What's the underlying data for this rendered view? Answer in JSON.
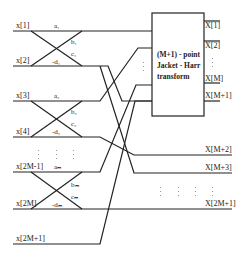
{
  "diagram": {
    "block": {
      "line1": "(M+1) - point",
      "line2": "Jacket - Harr",
      "line3": "transform"
    },
    "inputs": [
      "x[1]",
      "x[2]",
      "x[3]",
      "x[4]",
      "x[2M-1]",
      "x[2M]",
      "x[2M+1]"
    ],
    "coefficients": {
      "a1": "a₁",
      "b1": "b₁",
      "c1": "c₁",
      "d1": "-d₁",
      "a2": "a₂",
      "b2": "b₂",
      "c2": "c₂",
      "d2": "-d₂",
      "aM": "aₘ",
      "bM": "bₘ",
      "cM": "cₘ",
      "dM": "-dₘ"
    },
    "outputs_block": [
      "X[1]",
      "X[2]",
      "X[M]",
      "X[M+1]"
    ],
    "outputs_direct": [
      "X[M+2]",
      "X[M+3]",
      "X[2M+1]"
    ]
  }
}
